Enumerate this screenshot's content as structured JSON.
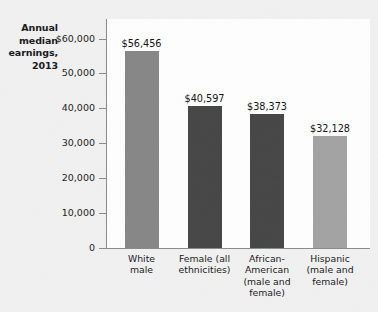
{
  "chart_data": {
    "type": "bar",
    "title": "",
    "ylabel": "Annual median earnings, 2013",
    "xlabel": "",
    "ylim": [
      0,
      60000
    ],
    "grid": false,
    "legend": "none",
    "yticks": [
      "$60,000",
      "50,000",
      "40,000",
      "30,000",
      "20,000",
      "10,000",
      "0"
    ],
    "ytick_values": [
      60000,
      50000,
      40000,
      30000,
      20000,
      10000,
      0
    ],
    "categories": [
      "White male",
      "Female (all ethnicities)",
      "African-American (male and female)",
      "Hispanic (male and female)"
    ],
    "category_lines": [
      [
        "White",
        "male"
      ],
      [
        "Female (all",
        "ethnicities)"
      ],
      [
        "African-",
        "American",
        "(male and",
        "female)"
      ],
      [
        "Hispanic",
        "(male and",
        "female)"
      ]
    ],
    "values": [
      56456,
      40597,
      38373,
      32128
    ],
    "value_labels": [
      "$56,456",
      "$40,597",
      "$38,373",
      "$32,128"
    ],
    "bar_colors": [
      "#868686",
      "#454545",
      "#454545",
      "#a2a2a2"
    ]
  },
  "axis_title_lines": [
    "Annual",
    "median",
    "earnings,",
    "2013"
  ],
  "colors": {
    "background": "#f1f1f1",
    "plot_background": "#fefefe",
    "axis": "#8a8a8a",
    "text": "#17171a"
  }
}
